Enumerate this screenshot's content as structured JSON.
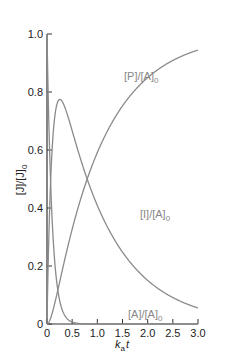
{
  "chart_data": {
    "type": "line",
    "title": "",
    "xlabel": "k_a t",
    "ylabel": "[J]/[J]_0",
    "xlim": [
      0,
      3.0
    ],
    "ylim": [
      0,
      1.0
    ],
    "x_ticks": [
      "0",
      "0.5",
      "1.0",
      "1.5",
      "2.0",
      "2.5",
      "3.0"
    ],
    "y_ticks": [
      "0",
      "0.2",
      "0.4",
      "0.6",
      "0.8",
      "1.0"
    ],
    "grid": false,
    "legend": "inline curve labels",
    "parameters": {
      "ka": 10,
      "kb": 1
    },
    "series": [
      {
        "name": "[A]/[A]_0",
        "label_main": "[A]/[A]",
        "label_sub": "0",
        "x": [
          0,
          0.05,
          0.1,
          0.2,
          0.3,
          0.5,
          1.0,
          3.0
        ],
        "values": [
          1.0,
          0.61,
          0.37,
          0.14,
          0.05,
          0.01,
          0.0,
          0.0
        ]
      },
      {
        "name": "[I]/[A]_0",
        "label_main": "[I]/[A]",
        "label_sub": "0",
        "x": [
          0,
          0.1,
          0.25,
          0.5,
          1.0,
          1.5,
          2.0,
          2.5,
          3.0
        ],
        "values": [
          0,
          0.58,
          0.77,
          0.61,
          0.37,
          0.22,
          0.14,
          0.08,
          0.05
        ]
      },
      {
        "name": "[P]/[A]_0",
        "label_main": "[P]/[A]",
        "label_sub": "0",
        "x": [
          0,
          0.25,
          0.5,
          1.0,
          1.5,
          2.0,
          2.5,
          3.0
        ],
        "values": [
          0,
          0.14,
          0.38,
          0.63,
          0.78,
          0.86,
          0.92,
          0.95
        ]
      }
    ],
    "colors": {
      "axis": "#333333",
      "curve": "#8a8a8a",
      "label": "#888888"
    }
  },
  "labels": {
    "xlabel_main": "k",
    "xlabel_sub": "a",
    "xlabel_tail": "t",
    "ylabel_main": "[J]/[J]",
    "ylabel_sub": "0"
  }
}
